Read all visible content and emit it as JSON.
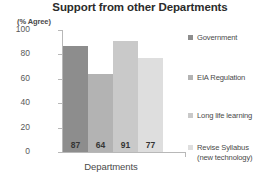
{
  "chart_data": {
    "type": "bar",
    "title": "Support from other Departments",
    "unit_note": "(% Agree)",
    "xlabel": "Departments",
    "ylabel": "",
    "ylim": [
      0,
      100
    ],
    "ytick_labels": [
      "100",
      "80",
      "60",
      "40",
      "20",
      "0"
    ],
    "ytick_values": [
      100,
      80,
      60,
      40,
      20,
      0
    ],
    "grid": false,
    "legend_position": "right",
    "categories": [
      "Government",
      "EIA Regulation",
      "Long life learning",
      "Revise Syllabus (new technology)"
    ],
    "values": [
      87,
      64,
      91,
      77
    ],
    "value_labels": [
      "87",
      "64",
      "91",
      "77"
    ],
    "bar_colors": [
      "#8d8d8d",
      "#b3b3b3",
      "#c9c9c9",
      "#dedede"
    ]
  },
  "legend": {
    "items": [
      {
        "label": "Government",
        "label_line2": "",
        "color": "#8d8d8d"
      },
      {
        "label": "EIA Regulation",
        "label_line2": "",
        "color": "#b3b3b3"
      },
      {
        "label": "Long life learning",
        "label_line2": "",
        "color": "#c9c9c9"
      },
      {
        "label": "Revise Syllabus",
        "label_line2": "(new technology)",
        "color": "#dedede"
      }
    ]
  },
  "colors": {
    "axis": "#b8b8b8",
    "title_text": "#2b2b2b",
    "body_text": "#4a4a4a",
    "background": "#ffffff"
  }
}
